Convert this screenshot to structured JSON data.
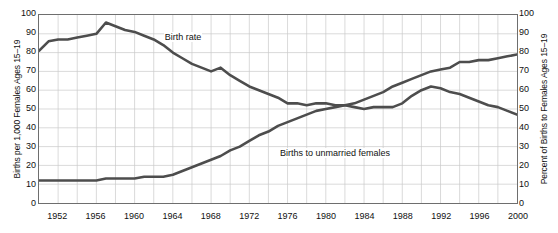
{
  "chart_data": {
    "type": "line",
    "title": "",
    "xlabel": "",
    "ylabel": "Births per 1,000 Females Ages 15–19",
    "ylabel_right": "Percent of Births to Females Ages 15–19",
    "xlim": [
      1950,
      2000
    ],
    "ylim": [
      0,
      100
    ],
    "ylim_right": [
      0,
      100
    ],
    "grid": true,
    "grid_x_step": 2,
    "grid_y_step": 10,
    "legend": "in-plot labels",
    "x_tick_labels": [
      "1952",
      "1956",
      "1960",
      "1964",
      "1968",
      "1972",
      "1976",
      "1980",
      "1984",
      "1988",
      "1992",
      "1996",
      "2000"
    ],
    "y_tick_labels_left": [
      "100",
      "90",
      "80",
      "70",
      "60",
      "50",
      "40",
      "30",
      "20",
      "10",
      "0"
    ],
    "y_tick_labels_right": [
      "100",
      "90",
      "80",
      "70",
      "60",
      "50",
      "40",
      "30",
      "20",
      "10",
      "0"
    ],
    "x": [
      1950,
      1951,
      1952,
      1953,
      1954,
      1955,
      1956,
      1957,
      1958,
      1959,
      1960,
      1961,
      1962,
      1963,
      1964,
      1965,
      1966,
      1967,
      1968,
      1969,
      1970,
      1971,
      1972,
      1973,
      1974,
      1975,
      1976,
      1977,
      1978,
      1979,
      1980,
      1981,
      1982,
      1983,
      1984,
      1985,
      1986,
      1987,
      1988,
      1989,
      1990,
      1991,
      1992,
      1993,
      1994,
      1995,
      1996,
      1997,
      1998,
      1999,
      2000
    ],
    "series": [
      {
        "name": "Birth rate",
        "axis": "left",
        "units": "births per 1,000 females ages 15-19",
        "color": "#4d4d4d",
        "label_x": 1963,
        "label_y": 88,
        "values": [
          81,
          86,
          87,
          87,
          88,
          89,
          90,
          96,
          94,
          92,
          91,
          89,
          87,
          84,
          80,
          77,
          74,
          72,
          70,
          72,
          68,
          65,
          62,
          60,
          58,
          56,
          53,
          53,
          52,
          53,
          53,
          52,
          52,
          51,
          50,
          51,
          51,
          51,
          53,
          57,
          60,
          62,
          61,
          59,
          58,
          56,
          54,
          52,
          51,
          49,
          47
        ]
      },
      {
        "name": "Births to unmarried females",
        "axis": "right",
        "units": "percent of births to females ages 15-19",
        "color": "#4d4d4d",
        "label_x": 1975,
        "label_y": 27,
        "values": [
          12,
          12,
          12,
          12,
          12,
          12,
          12,
          13,
          13,
          13,
          13,
          14,
          14,
          14,
          15,
          17,
          19,
          21,
          23,
          25,
          28,
          30,
          33,
          36,
          38,
          41,
          43,
          45,
          47,
          49,
          50,
          51,
          52,
          53,
          55,
          57,
          59,
          62,
          64,
          66,
          68,
          70,
          71,
          72,
          75,
          75,
          76,
          76,
          77,
          78,
          79
        ]
      }
    ]
  }
}
